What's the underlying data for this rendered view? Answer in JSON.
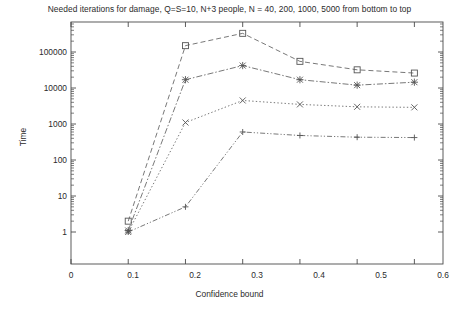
{
  "chart_data": {
    "type": "line",
    "title": "Needed iterations for damage, Q=S=10, N+3 people, N = 40, 200, 1000, 5000 from bottom to top",
    "xlabel": "Confidence bound",
    "ylabel": "Time",
    "xlim": [
      0,
      0.65
    ],
    "ylim": [
      1,
      400000
    ],
    "yscale": "log",
    "grid": false,
    "legend": "none",
    "xticks": [
      "0",
      "0.1",
      "0.2",
      "0.3",
      "0.4",
      "0.5",
      "0.6"
    ],
    "xtick_values": [
      0,
      0.1,
      0.2,
      0.3,
      0.4,
      0.5,
      0.6
    ],
    "yticks": [
      "1",
      "10",
      "100",
      "1000",
      "10000",
      "100000"
    ],
    "ytick_values": [
      1,
      10,
      100,
      1000,
      10000,
      100000
    ],
    "x": [
      0.1,
      0.2,
      0.3,
      0.4,
      0.5,
      0.6
    ],
    "series": [
      {
        "name": "N = 5000",
        "marker": "square",
        "linestyle": "dashed",
        "color": "#555555",
        "values": [
          2,
          150000,
          330000,
          55000,
          32000,
          26000
        ]
      },
      {
        "name": "N = 1000",
        "marker": "star",
        "linestyle": "dash-dot",
        "color": "#555555",
        "values": [
          1.1,
          17000,
          42000,
          17000,
          12000,
          14500
        ]
      },
      {
        "name": "N = 200",
        "marker": "cross",
        "linestyle": "dotted",
        "color": "#555555",
        "values": [
          1,
          1100,
          4500,
          3500,
          3000,
          2900
        ]
      },
      {
        "name": "N = 40",
        "marker": "plus",
        "linestyle": "dash-dot-dot",
        "color": "#555555",
        "values": [
          1,
          5,
          600,
          480,
          430,
          420
        ]
      }
    ]
  }
}
